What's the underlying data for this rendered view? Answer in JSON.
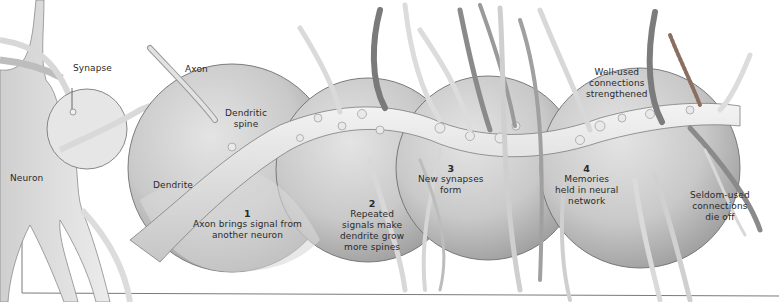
{
  "diagram": {
    "type": "illustration",
    "colors": {
      "background": "#ffffff",
      "circle_fill": "#d4d4d4",
      "circle_shade": "#a8a8a8",
      "dendrite": "#e8e8e8",
      "axon": "#cfcfcf",
      "dark_axon": "#7a7a7a",
      "outline": "#6e6e6e",
      "text": "#2a2a2a",
      "frame": "#7a7a7a"
    },
    "labels": {
      "synapse": "Synapse",
      "neuron": "Neuron",
      "axon": "Axon",
      "dendritic_spine_1": "Dendritic",
      "dendritic_spine_2": "spine",
      "dendrite": "Dendrite",
      "well_used_1": "Well-used",
      "well_used_2": "connections",
      "well_used_3": "strengthened",
      "seldom_used_1": "Seldom-used",
      "seldom_used_2": "connections",
      "seldom_used_3": "die off"
    },
    "stages": [
      {
        "number": "1",
        "lines": [
          "Axon brings signal from",
          "another neuron"
        ]
      },
      {
        "number": "2",
        "lines": [
          "Repeated",
          "signals make",
          "dendrite grow",
          "more spines"
        ]
      },
      {
        "number": "3",
        "lines": [
          "New synapses",
          "form"
        ]
      },
      {
        "number": "4",
        "lines": [
          "Memories",
          "held in neural",
          "network"
        ]
      }
    ]
  }
}
